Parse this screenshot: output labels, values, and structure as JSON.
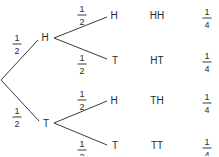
{
  "diagram": {
    "type": "probability-tree",
    "line_color": "#3a3a3a",
    "text_color": "#2b2b2b",
    "level1": {
      "nodes": [
        {
          "label": "H",
          "prob": {
            "num": "1",
            "den": "2"
          }
        },
        {
          "label": "T",
          "prob": {
            "num": "1",
            "den": "2"
          }
        }
      ]
    },
    "level2": {
      "nodes": [
        {
          "label": "H",
          "prob": {
            "num": "1",
            "den": "2"
          }
        },
        {
          "label": "T",
          "prob": {
            "num": "1",
            "den": "2"
          }
        },
        {
          "label": "H",
          "prob": {
            "num": "1",
            "den": "2"
          }
        },
        {
          "label": "T",
          "prob": {
            "num": "1",
            "den": "2"
          }
        }
      ]
    },
    "outcomes": [
      {
        "label": "HH",
        "prob": {
          "num": "1",
          "den": "4"
        }
      },
      {
        "label": "HT",
        "prob": {
          "num": "1",
          "den": "4"
        }
      },
      {
        "label": "TH",
        "prob": {
          "num": "1",
          "den": "4"
        }
      },
      {
        "label": "TT",
        "prob": {
          "num": "1",
          "den": "4"
        }
      }
    ]
  }
}
